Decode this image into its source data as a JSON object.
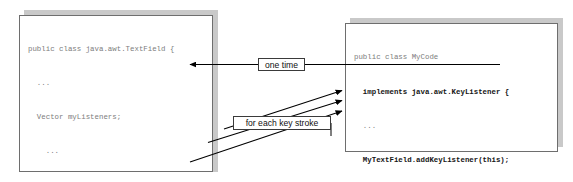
{
  "diagram": {
    "background": "#ffffff",
    "code_text_color": "#7d7d7d",
    "bold_text_color": "#151515",
    "box_border_color": "#6e6e6e",
    "shadow_color": "#c9c9c9",
    "arrow_color": "#000000"
  },
  "left_box": {
    "name": "java.awt.TextField source box",
    "lines": [
      {
        "text": "public class java.awt.TextField {",
        "bold": false
      },
      {
        "text": "  ...",
        "bold": false
      },
      {
        "text": "  Vector myListeners;",
        "bold": false
      },
      {
        "text": "    ...",
        "bold": false
      },
      {
        "text": "  public void addKeyListener() {",
        "bold": false,
        "bold_span": "addKeyListener"
      },
      {
        "text": "   myListeners.add();",
        "bold": false
      },
      {
        "text": "  }",
        "bold": false
      },
      {
        "text": "",
        "bold": false
      },
      {
        "text": "  public void dispatchEvent(Event e) {",
        "bold": false
      },
      {
        "text": "   //iterate through myListeners",
        "bold": false
      },
      {
        "text": "   //and call the key event listeners",
        "bold": false
      },
      {
        "text": "      myListeners[i].keyTyped(e);",
        "bold": false
      },
      {
        "text": "    }",
        "bold": false
      }
    ]
  },
  "right_box": {
    "name": "MyCode listener implementation box",
    "lines": [
      {
        "text": "public class MyCode",
        "bold": false
      },
      {
        "text": "  implements java.awt.KeyListener {",
        "bold": true
      },
      {
        "text": "  ...",
        "bold": false
      },
      {
        "text": "  MyTextField.addKeyListener(this);",
        "bold": true
      },
      {
        "text": "",
        "bold": false
      },
      {
        "text": "public void keyTyped(keyEvent k) {",
        "bold": false
      },
      {
        "text": "// want this to be called",
        "bold": false
      },
      {
        "text": "}",
        "bold": false
      },
      {
        "text": "",
        "bold": false
      },
      {
        "text": "  ...",
        "bold": false
      }
    ]
  },
  "callouts": {
    "one_time": "one time",
    "for_each_key_stroke": "for each key stroke"
  },
  "arrows": [
    {
      "name": "one-time-arrow",
      "from": "MyTextField.addKeyListener(this);",
      "to": "addKeyListener()"
    },
    {
      "name": "key-stroke-arrow-1",
      "from": "//iterate through myListeners",
      "to": "public void keyTyped(keyEvent k) {"
    },
    {
      "name": "key-stroke-arrow-2",
      "from": "//and call the key event listeners",
      "to": "// want this to be called"
    },
    {
      "name": "key-stroke-arrow-3",
      "from": "myListeners[i].keyTyped(e);",
      "to": "}"
    }
  ]
}
